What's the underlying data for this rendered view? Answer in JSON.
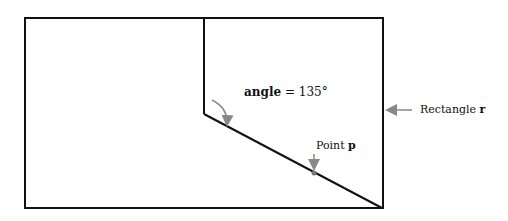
{
  "diagram": {
    "rectangle": {
      "x": 25,
      "y": 18,
      "width": 358,
      "height": 190
    },
    "vertical_line": {
      "x": 204,
      "y1": 18,
      "y2": 114
    },
    "diagonal_line": {
      "x1": 204,
      "y1": 114,
      "x2": 382,
      "y2": 208
    },
    "point": {
      "x": 314,
      "y": 171
    }
  },
  "labels": {
    "angle_name": "angle",
    "angle_value": " = 135°",
    "rect_prefix": "Rectangle ",
    "rect_var": "r",
    "point_prefix": "Point ",
    "point_var": "p"
  },
  "colors": {
    "line": "#111111",
    "arrow": "#888888"
  }
}
